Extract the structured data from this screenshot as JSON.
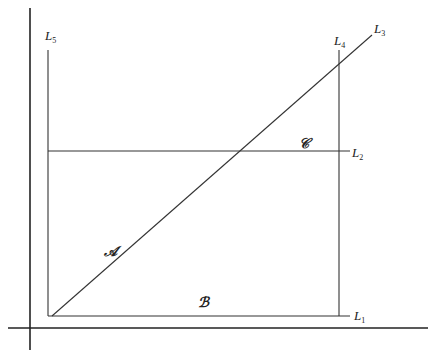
{
  "diagram": {
    "axes": {
      "vertical": {
        "x": 30,
        "y1": 8,
        "y2": 350
      },
      "horizontal": {
        "y": 328,
        "x1": 8,
        "x2": 428
      }
    },
    "lines": [
      {
        "id": "L1",
        "x1": 48,
        "y1": 316,
        "x2": 350,
        "y2": 316,
        "label": "L",
        "sub": "1",
        "lx": 354,
        "ly": 320
      },
      {
        "id": "L2",
        "x1": 48,
        "y1": 151,
        "x2": 350,
        "y2": 151,
        "label": "L",
        "sub": "2",
        "lx": 352,
        "ly": 157
      },
      {
        "id": "L3",
        "x1": 52,
        "y1": 316,
        "x2": 372,
        "y2": 35,
        "label": "L",
        "sub": "3",
        "lx": 374,
        "ly": 33
      },
      {
        "id": "L4",
        "x1": 339,
        "y1": 50,
        "x2": 339,
        "y2": 316,
        "label": "L",
        "sub": "4",
        "lx": 334,
        "ly": 45
      },
      {
        "id": "L5",
        "x1": 48,
        "y1": 50,
        "x2": 48,
        "y2": 316,
        "label": "L",
        "sub": "5",
        "lx": 45,
        "ly": 40
      }
    ],
    "regions": [
      {
        "id": "A",
        "label": "𝒜",
        "x": 104,
        "y": 256
      },
      {
        "id": "B",
        "label": "ℬ",
        "x": 198,
        "y": 307
      },
      {
        "id": "C",
        "label": "𝒞",
        "x": 299,
        "y": 148
      }
    ],
    "stroke_color": "#333333"
  }
}
